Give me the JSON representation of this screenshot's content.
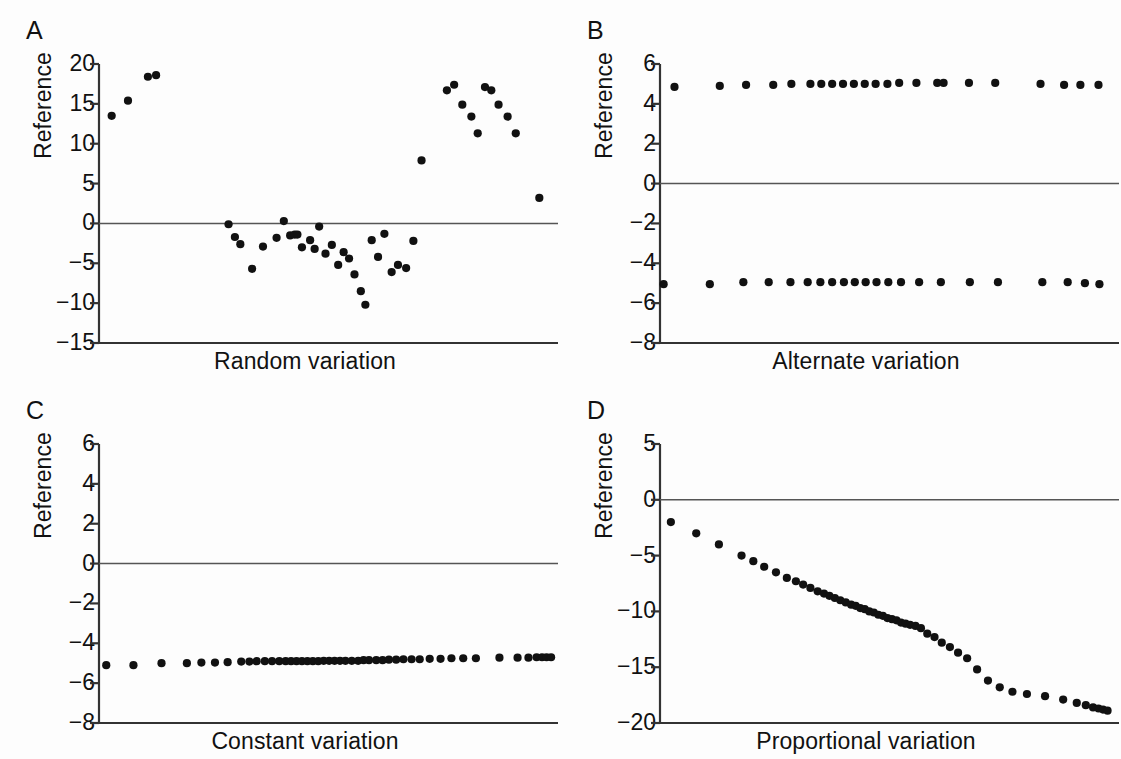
{
  "figure": {
    "background": "#fdfdfd",
    "marker_color": "#111111",
    "axis_color": "#333333",
    "panels": [
      "A",
      "B",
      "C",
      "D"
    ]
  },
  "chart_data": [
    {
      "id": "A",
      "panel_letter": "A",
      "type": "scatter",
      "title": "",
      "xlabel": "Random variation",
      "ylabel": "Reference",
      "yticks": [
        20,
        15,
        10,
        5,
        0,
        -5,
        -10,
        -15
      ],
      "ytick_labels": [
        "20",
        "15",
        "10",
        "5",
        "0",
        "−5",
        "−10",
        "−15"
      ],
      "ylim": [
        -15,
        20
      ],
      "xlim": [
        0,
        50
      ],
      "grid": false,
      "legend": "none",
      "reference_line_y": 0,
      "x": [
        1.4,
        3.2,
        5.4,
        6.3,
        14.3,
        15.0,
        15.6,
        16.9,
        18.1,
        19.6,
        20.4,
        21.1,
        21.6,
        21.9,
        22.4,
        23.3,
        23.8,
        24.3,
        25.0,
        25.7,
        26.4,
        27.0,
        27.6,
        28.2,
        28.9,
        29.4,
        30.1,
        30.8,
        31.5,
        32.3,
        33.0,
        33.9,
        34.7,
        35.6,
        38.4,
        39.2,
        40.1,
        41.1,
        41.8,
        42.6,
        43.3,
        44.1,
        45.1,
        46.0,
        48.6
      ],
      "y": [
        13.5,
        15.4,
        18.4,
        18.6,
        -0.1,
        -1.7,
        -2.6,
        -5.7,
        -2.9,
        -1.8,
        0.3,
        -1.5,
        -1.4,
        -1.4,
        -3.0,
        -2.1,
        -3.2,
        -0.4,
        -3.8,
        -2.7,
        -5.2,
        -3.6,
        -4.4,
        -6.4,
        -8.5,
        -10.2,
        -2.1,
        -4.2,
        -1.3,
        -6.1,
        -5.2,
        -5.6,
        -2.2,
        7.9,
        16.7,
        17.4,
        14.9,
        13.4,
        11.3,
        17.1,
        16.7,
        14.9,
        13.4,
        11.3,
        3.2
      ]
    },
    {
      "id": "B",
      "panel_letter": "B",
      "type": "scatter",
      "title": "",
      "xlabel": "Alternate variation",
      "ylabel": "Reference",
      "yticks": [
        6,
        4,
        2,
        0,
        -2,
        -4,
        -6,
        -8
      ],
      "ytick_labels": [
        "6",
        "4",
        "2",
        "0",
        "−2",
        "−4",
        "−6",
        "−8"
      ],
      "ylim": [
        -8,
        6
      ],
      "xlim": [
        0,
        50
      ],
      "grid": false,
      "legend": "none",
      "reference_line_y": 0,
      "series": [
        {
          "name": "upper",
          "x": [
            1.6,
            6.6,
            9.5,
            12.5,
            14.5,
            16.6,
            17.8,
            19.0,
            20.2,
            21.4,
            22.6,
            23.8,
            25.1,
            26.4,
            28.3,
            30.6,
            31.3,
            34.1,
            37.0,
            42.0,
            44.6,
            46.4,
            48.4
          ],
          "y": [
            4.85,
            4.9,
            4.95,
            4.95,
            5.0,
            5.0,
            5.0,
            5.0,
            5.0,
            5.0,
            5.0,
            5.0,
            5.0,
            5.05,
            5.05,
            5.05,
            5.05,
            5.05,
            5.05,
            5.0,
            4.95,
            4.95,
            4.95
          ]
        },
        {
          "name": "lower",
          "x": [
            0.4,
            5.5,
            9.2,
            12.0,
            14.4,
            16.3,
            17.7,
            19.0,
            20.3,
            21.5,
            22.7,
            23.9,
            25.2,
            26.6,
            28.6,
            31.0,
            34.2,
            37.3,
            42.2,
            45.0,
            46.9,
            48.5
          ],
          "y": [
            -5.05,
            -5.05,
            -4.95,
            -4.95,
            -4.95,
            -4.95,
            -4.95,
            -4.95,
            -4.95,
            -4.95,
            -4.95,
            -4.95,
            -4.95,
            -4.95,
            -4.95,
            -4.95,
            -4.95,
            -4.95,
            -4.95,
            -4.95,
            -5.0,
            -5.05
          ]
        }
      ]
    },
    {
      "id": "C",
      "panel_letter": "C",
      "type": "scatter",
      "title": "",
      "xlabel": "Constant variation",
      "ylabel": "Reference",
      "yticks": [
        6,
        4,
        2,
        0,
        -2,
        -4,
        -6,
        -8
      ],
      "ytick_labels": [
        "6",
        "4",
        "2",
        "0",
        "−2",
        "−4",
        "−6",
        "−8"
      ],
      "ylim": [
        -8,
        6
      ],
      "xlim": [
        0,
        50
      ],
      "grid": false,
      "legend": "none",
      "reference_line_y": 0,
      "x": [
        0.8,
        3.8,
        6.9,
        9.7,
        11.3,
        12.8,
        14.2,
        15.7,
        16.6,
        17.4,
        18.3,
        19.1,
        19.9,
        20.6,
        21.2,
        21.8,
        22.4,
        23.0,
        23.6,
        24.2,
        24.8,
        25.4,
        26.0,
        26.6,
        27.2,
        27.9,
        28.6,
        29.2,
        29.8,
        30.6,
        31.3,
        32.0,
        32.8,
        33.6,
        34.5,
        35.4,
        36.5,
        37.7,
        38.9,
        40.2,
        41.6,
        44.2,
        46.2,
        47.4,
        48.3,
        48.9,
        49.4,
        49.9
      ],
      "y": [
        -5.1,
        -5.1,
        -5.0,
        -5.0,
        -4.97,
        -4.97,
        -4.95,
        -4.92,
        -4.92,
        -4.9,
        -4.9,
        -4.9,
        -4.9,
        -4.9,
        -4.9,
        -4.9,
        -4.9,
        -4.9,
        -4.9,
        -4.9,
        -4.88,
        -4.88,
        -4.88,
        -4.88,
        -4.88,
        -4.88,
        -4.88,
        -4.85,
        -4.85,
        -4.85,
        -4.85,
        -4.82,
        -4.82,
        -4.8,
        -4.8,
        -4.8,
        -4.78,
        -4.78,
        -4.75,
        -4.75,
        -4.75,
        -4.72,
        -4.72,
        -4.72,
        -4.7,
        -4.7,
        -4.7,
        -4.7
      ]
    },
    {
      "id": "D",
      "panel_letter": "D",
      "type": "scatter",
      "title": "",
      "xlabel": "Proportional variation",
      "ylabel": "Reference",
      "yticks": [
        5,
        0,
        -5,
        -10,
        -15,
        -20
      ],
      "ytick_labels": [
        "5",
        "0",
        "−5",
        "−10",
        "−15",
        "−20"
      ],
      "ylim": [
        -20,
        5
      ],
      "xlim": [
        0,
        50
      ],
      "grid": false,
      "legend": "none",
      "reference_line_y": 0,
      "x": [
        1.2,
        4.0,
        6.5,
        9.0,
        10.3,
        11.5,
        12.8,
        14.0,
        15.0,
        15.8,
        16.6,
        17.4,
        18.1,
        18.7,
        19.3,
        19.9,
        20.5,
        21.1,
        21.6,
        22.1,
        22.6,
        23.1,
        23.6,
        24.1,
        24.6,
        25.1,
        25.6,
        26.1,
        26.6,
        27.1,
        27.6,
        28.2,
        28.8,
        29.5,
        30.3,
        31.1,
        32.0,
        32.9,
        33.9,
        35.0,
        36.2,
        37.5,
        38.9,
        40.5,
        42.5,
        44.5,
        46.0,
        47.0,
        47.8,
        48.4,
        48.9,
        49.4
      ],
      "y": [
        -2.0,
        -3.0,
        -4.0,
        -5.0,
        -5.5,
        -6.0,
        -6.5,
        -7.0,
        -7.3,
        -7.6,
        -7.9,
        -8.2,
        -8.4,
        -8.6,
        -8.8,
        -9.0,
        -9.2,
        -9.4,
        -9.5,
        -9.7,
        -9.8,
        -10.0,
        -10.1,
        -10.3,
        -10.4,
        -10.6,
        -10.7,
        -10.8,
        -11.0,
        -11.1,
        -11.2,
        -11.3,
        -11.5,
        -12.0,
        -12.3,
        -12.8,
        -13.2,
        -13.7,
        -14.2,
        -15.2,
        -16.2,
        -16.8,
        -17.2,
        -17.4,
        -17.6,
        -17.9,
        -18.2,
        -18.4,
        -18.6,
        -18.7,
        -18.8,
        -18.9
      ]
    }
  ]
}
